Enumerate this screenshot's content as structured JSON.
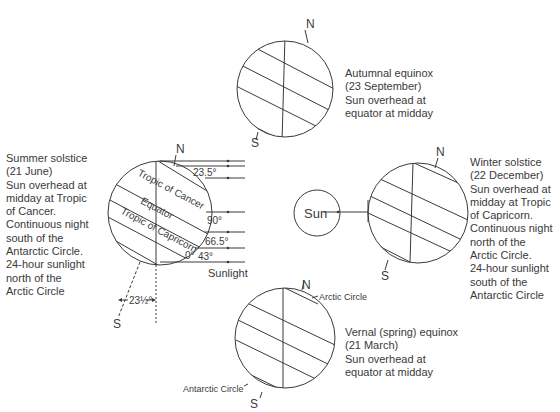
{
  "diagram": {
    "sun_label": "Sun",
    "sunlight_label": "Sunlight",
    "pole_north": "N",
    "pole_south": "S",
    "globes": {
      "autumnal": {
        "caption": "Autumnal equinox\n(23 September)\nSun overhead at\nequator at midday"
      },
      "summer": {
        "caption": "Summer solstice\n(21 June)\nSun overhead at\nmidday at Tropic\nof Cancer.\nContinuous night\nsouth of the\nAntarctic Circle.\n24-hour sunlight\nnorth of the\nArctic Circle",
        "lines": {
          "tropic_cancer": "Tropic of Cancer",
          "equator": "Equator",
          "tropic_capricorn": "Tropic of Capricorn"
        },
        "angles": [
          "23.5°",
          "90°",
          "66.5°",
          "43°",
          "0°"
        ],
        "tilt_label": "23½°"
      },
      "winter": {
        "caption": "Winter solstice\n(22 December)\nSun overhead at\nmidday at Tropic\nof Capricorn.\nContinuous night\nnorth of the\nArctic Circle.\n24-hour sunlight\nsouth of the\nAntarctic Circle"
      },
      "vernal": {
        "caption": "Vernal (spring) equinox\n(21 March)\nSun overhead at\nequator at midday",
        "arctic_label": "Arctic Circle",
        "antarctic_label": "Antarctic Circle"
      }
    }
  }
}
